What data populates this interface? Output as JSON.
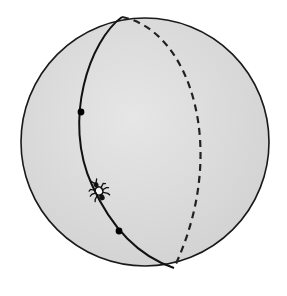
{
  "diagram": {
    "title": "",
    "description": "Sphere with a great circle; an ant walking along the great circle between two marked points",
    "colors": {
      "background": "#ffffff",
      "sphere_fill": "#dcdcdc",
      "outline": "#1a1a1a",
      "great_circle": "#111111",
      "points": "#000000"
    },
    "sphere": {
      "cx": 145,
      "cy": 142,
      "r": 124
    },
    "great_circle": {
      "front_style": "solid",
      "back_style": "dashed"
    },
    "points": [
      {
        "name": "point-upper",
        "x": 81,
        "y": 112
      },
      {
        "name": "point-lower",
        "x": 119,
        "y": 231
      }
    ],
    "ant": {
      "x": 99,
      "y": 191,
      "icon": "ant-icon"
    }
  }
}
